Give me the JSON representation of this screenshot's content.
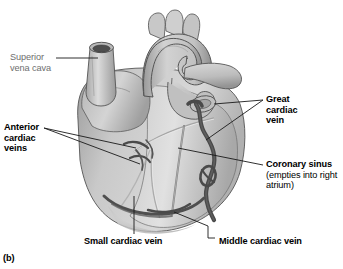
{
  "figure": {
    "caption": "(b)"
  },
  "labels": {
    "superior_vena_cava": {
      "line1": "Superior",
      "line2": "vena cava"
    },
    "anterior_cardiac_veins": {
      "line1": "Anterior",
      "line2": "cardiac",
      "line3": "veins"
    },
    "great_cardiac_vein": {
      "line1": "Great",
      "line2": "cardiac",
      "line3": "vein"
    },
    "coronary_sinus": {
      "bold": "Coronary sinus",
      "note": " (empties into right atrium)"
    },
    "small_cardiac_vein": "Small cardiac vein",
    "middle_cardiac_vein": "Middle cardiac vein"
  },
  "colors": {
    "background": "#ffffff",
    "label_gray": "#6e6e6e",
    "label_black": "#000000",
    "leader_line": "#1a1a1a",
    "heart_light": "#e6e6e6",
    "heart_mid": "#bdbdbd",
    "heart_dark": "#8f8f8f",
    "vessel_dark": "#4a4a4a",
    "outline": "#3a3a3a"
  }
}
